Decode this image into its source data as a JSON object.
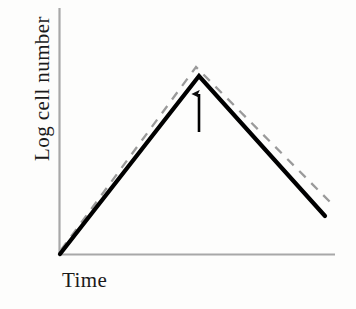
{
  "figure": {
    "background_color": "#fdfdfc",
    "width": 356,
    "height": 309
  },
  "axes": {
    "y_label": "Log cell number",
    "x_label": "Time",
    "axis_color": "#a8a8a8",
    "has_ticks": false,
    "has_tick_labels": false,
    "has_gridlines": false,
    "y_axis": {
      "x": 59,
      "y_top": 8,
      "y_bottom": 255
    },
    "x_axis": {
      "y": 255,
      "x_left": 59,
      "x_right": 335
    }
  },
  "chart_data": {
    "type": "line",
    "title": "",
    "xlabel": "Time",
    "ylabel": "Log cell number",
    "xlim": [
      0,
      100
    ],
    "ylim": [
      0,
      100
    ],
    "grid": false,
    "legend": false,
    "axis_ticks": "none",
    "series": [
      {
        "name": "solid-curve",
        "style": "solid",
        "color": "#000000",
        "width": 4,
        "points": [
          {
            "x": 0,
            "y": 0,
            "px": 60,
            "py": 254
          },
          {
            "x": 50,
            "y": 100,
            "px": 199,
            "py": 76
          },
          {
            "x": 95,
            "y": 22,
            "px": 325,
            "py": 216
          }
        ]
      },
      {
        "name": "dashed-reference-curve",
        "style": "dashed",
        "color": "#9a9a9a",
        "width": 2,
        "dash": [
          9,
          8
        ],
        "points": [
          {
            "x": 0,
            "y": 2,
            "px": 61,
            "py": 250
          },
          {
            "x": 49,
            "y": 105,
            "px": 196,
            "py": 67
          },
          {
            "x": 99,
            "y": 27,
            "px": 334,
            "py": 206
          }
        ]
      }
    ],
    "annotations": [
      {
        "name": "peak-arrow",
        "type": "arrow",
        "direction": "up",
        "color": "#000000",
        "label": "",
        "tail": {
          "px": 199,
          "py": 132
        },
        "head": {
          "px": 199,
          "py": 86
        },
        "points_at": "peak of solid curve"
      }
    ]
  }
}
